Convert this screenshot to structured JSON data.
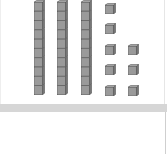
{
  "model": {
    "type": "base-ten-blocks",
    "tens_rods": 3,
    "units": 8,
    "value_represented": 38,
    "rod_x": [
      33,
      56,
      80
    ],
    "unit_positions": [
      {
        "x": 104,
        "y": 0
      },
      {
        "x": 104,
        "y": 20
      },
      {
        "x": 104,
        "y": 41
      },
      {
        "x": 127,
        "y": 41
      },
      {
        "x": 104,
        "y": 61
      },
      {
        "x": 127,
        "y": 61
      },
      {
        "x": 104,
        "y": 82
      },
      {
        "x": 127,
        "y": 82
      }
    ]
  },
  "answer": {
    "value": ""
  },
  "colors": {
    "block_face": "#9a9a9a",
    "block_top": "#c4c4c4",
    "block_edge": "#555555",
    "separator": "#d6d6d6"
  }
}
